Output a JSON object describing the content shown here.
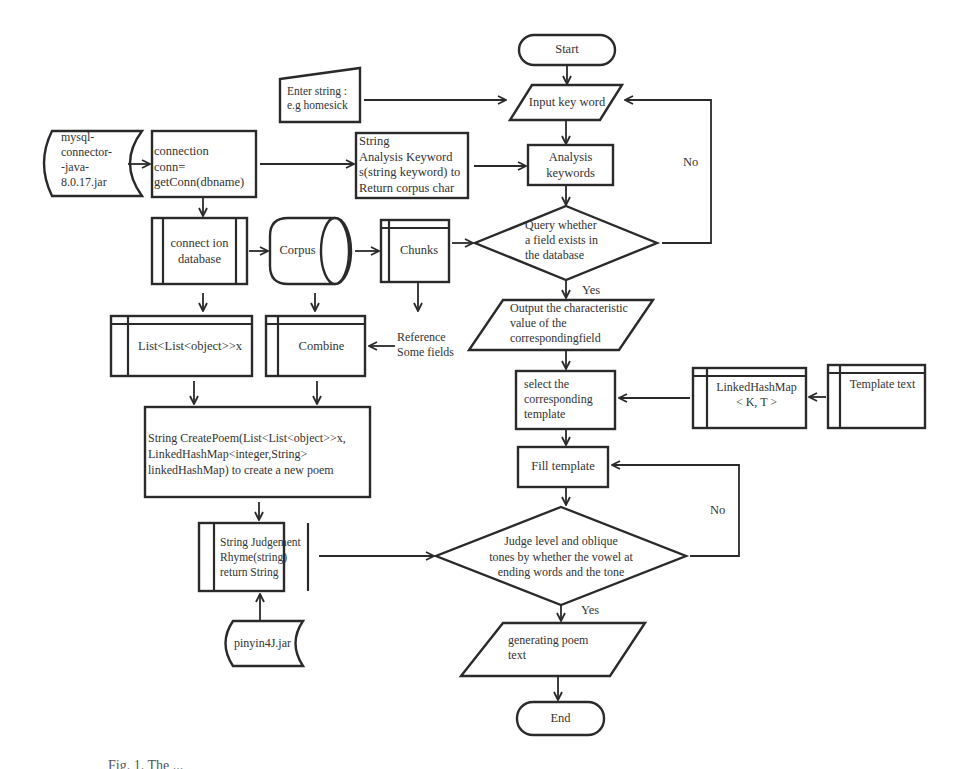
{
  "diagram": {
    "type": "flowchart",
    "nodes": {
      "start": {
        "shape": "terminator",
        "label": "Start"
      },
      "enter_string": {
        "shape": "manual-input",
        "label": "Enter string :\ne.g homesick"
      },
      "input_keyword": {
        "shape": "parallelogram",
        "label": "Input key word"
      },
      "mysql_connector": {
        "shape": "stored-data",
        "label": "mysql-\nconnector-\n-java-\n8.0.17.jar"
      },
      "connection_conn": {
        "shape": "process",
        "label": "connection\n conn=\ngetConn(dbname)"
      },
      "string_analysis": {
        "shape": "process",
        "label": "String\nAnalysis Keyword\ns(string keyword) to\nReturn corpus char"
      },
      "analysis_keywords": {
        "shape": "process",
        "label": "Analysis\nkeywords"
      },
      "connection_database": {
        "shape": "predefined-process",
        "label": "connect ion\ndatabase"
      },
      "corpus": {
        "shape": "database",
        "label": "Corpus"
      },
      "chunks": {
        "shape": "internal-storage",
        "label": "Chunks"
      },
      "query_field": {
        "shape": "decision",
        "label": "Query whether\na field exists in\nthe database"
      },
      "list_object": {
        "shape": "internal-storage",
        "label": "List<List<object>>x"
      },
      "combine": {
        "shape": "internal-storage",
        "label": "Combine"
      },
      "reference_fields": {
        "shape": "text",
        "label": "Reference\nSome fields"
      },
      "output_value": {
        "shape": "parallelogram",
        "label": "Output  the characteristic\nvalue   of  the\ncorrespondingfield"
      },
      "select_template": {
        "shape": "process",
        "label": "select the\ncorresponding\ntemplate"
      },
      "linked_hashmap": {
        "shape": "internal-storage",
        "label": "LinkedHashMap\n< K, T >"
      },
      "template_text": {
        "shape": "internal-storage",
        "label": "Template text"
      },
      "create_poem": {
        "shape": "process",
        "label": "String CreatePoem(List<List<object>>x,\nLinkedHashMap<integer,String>\nlinkedHashMap) to create a new poem"
      },
      "fill_template": {
        "shape": "process",
        "label": "Fill template"
      },
      "judgement_rhyme": {
        "shape": "predefined-process",
        "label": "String Judgement\nRhyme(string)\nreturn String"
      },
      "judge_tones": {
        "shape": "decision",
        "label": "Judge level and oblique\ntones by whether the vowel at\nending words and the tone"
      },
      "pinyin4j": {
        "shape": "stored-data",
        "label": "pinyin4J.jar"
      },
      "generating_poem": {
        "shape": "parallelogram",
        "label": "generating poem\ntext"
      },
      "end": {
        "shape": "terminator",
        "label": "End"
      }
    },
    "edge_labels": {
      "no_1": "No",
      "yes_1": "Yes",
      "no_2": "No",
      "yes_2": "Yes"
    },
    "edges": [
      [
        "start",
        "input_keyword"
      ],
      [
        "enter_string",
        "input_keyword"
      ],
      [
        "input_keyword",
        "analysis_keywords"
      ],
      [
        "mysql_connector",
        "connection_conn"
      ],
      [
        "connection_conn",
        "string_analysis"
      ],
      [
        "string_analysis",
        "analysis_keywords"
      ],
      [
        "analysis_keywords",
        "query_field"
      ],
      [
        "connection_conn",
        "connection_database"
      ],
      [
        "connection_database",
        "corpus"
      ],
      [
        "corpus",
        "chunks"
      ],
      [
        "chunks",
        "query_field"
      ],
      [
        "query_field",
        "input_keyword",
        "No"
      ],
      [
        "query_field",
        "output_value",
        "Yes"
      ],
      [
        "connection_database",
        "list_object"
      ],
      [
        "corpus",
        "combine"
      ],
      [
        "chunks",
        "reference_fields"
      ],
      [
        "reference_fields",
        "combine"
      ],
      [
        "output_value",
        "select_template"
      ],
      [
        "template_text",
        "linked_hashmap"
      ],
      [
        "linked_hashmap",
        "select_template"
      ],
      [
        "list_object",
        "create_poem"
      ],
      [
        "combine",
        "create_poem"
      ],
      [
        "create_poem",
        "judgement_rhyme"
      ],
      [
        "pinyin4j",
        "judgement_rhyme"
      ],
      [
        "select_template",
        "fill_template"
      ],
      [
        "fill_template",
        "judge_tones"
      ],
      [
        "judgement_rhyme",
        "judge_tones"
      ],
      [
        "judge_tones",
        "fill_template",
        "No"
      ],
      [
        "judge_tones",
        "generating_poem",
        "Yes"
      ],
      [
        "generating_poem",
        "end"
      ]
    ]
  },
  "caption": "Fig. 1.  The ..."
}
